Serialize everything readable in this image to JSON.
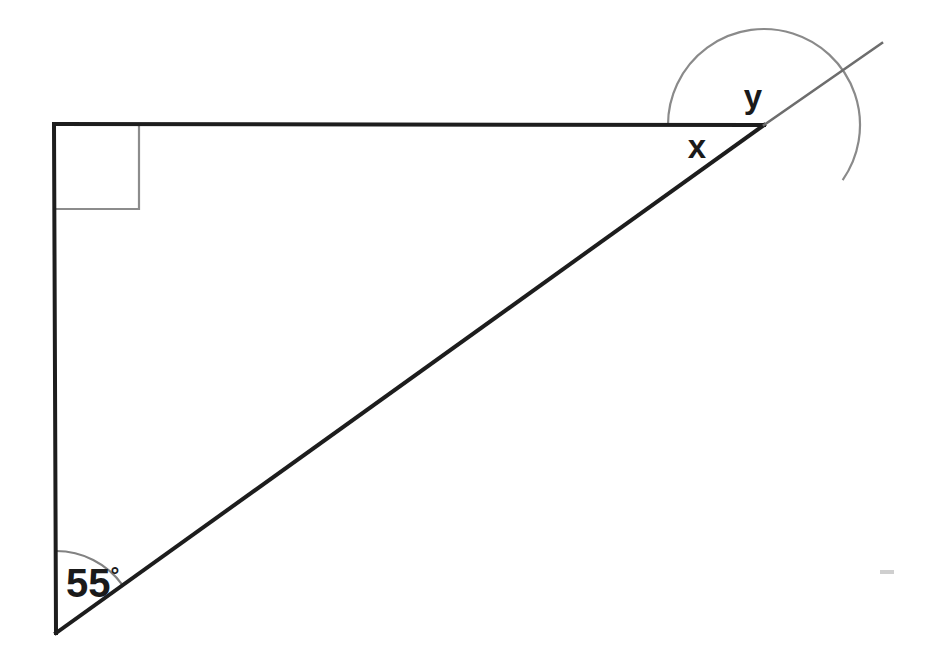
{
  "diagram": {
    "kind": "geometry-figure",
    "background_color": "#ffffff",
    "stroke_color_main": "#1d1d1d",
    "stroke_color_arc": "#7a7a7a",
    "stroke_color_square": "#8c8c8c",
    "labels": {
      "angle_x": "x",
      "angle_y": "y",
      "angle_known_value": "55",
      "degree_symbol": "°",
      "angle_known_full": "55°"
    },
    "vertices": {
      "top_left": {
        "name": "right-angle-vertex",
        "x": 54,
        "y": 124
      },
      "top_right": {
        "name": "exterior-angle-vertex",
        "x": 764,
        "y": 125
      },
      "bottom_left": {
        "name": "base-angle-vertex",
        "x": 56,
        "y": 633
      },
      "ray_end": {
        "name": "ray-endpoint",
        "x": 882,
        "y": 43
      }
    },
    "segments": [
      {
        "name": "top-horizontal-segment",
        "x1": 54,
        "y1": 124,
        "x2": 764,
        "y2": 125
      },
      {
        "name": "left-vertical-segment",
        "x1": 54,
        "y1": 124,
        "x2": 56,
        "y2": 633
      },
      {
        "name": "hypotenuse-segment",
        "x1": 56,
        "y1": 633,
        "x2": 764,
        "y2": 125
      },
      {
        "name": "extension-ray",
        "x1": 764,
        "y1": 125,
        "x2": 882,
        "y2": 43
      }
    ],
    "right_angle_marker": {
      "name": "right-angle-square",
      "x": 54,
      "y": 124,
      "size": 85
    },
    "arcs": {
      "base_angle_arc": {
        "name": "arc-55-degrees",
        "cx": 56,
        "cy": 633,
        "r": 82,
        "start_deg": 270,
        "end_deg": 324
      },
      "exterior_angle_arc": {
        "name": "arc-x-and-y",
        "cx": 764,
        "cy": 125,
        "r": 96,
        "start_deg": 180,
        "end_deg": 395
      }
    },
    "label_positions": {
      "angle_y": {
        "x": 753,
        "y": 108
      },
      "angle_x": {
        "x": 697,
        "y": 158
      },
      "angle_55": {
        "x": 66,
        "y": 597
      }
    },
    "artifact": {
      "name": "scan-artifact-mark",
      "x": 880,
      "y": 570,
      "width": 14,
      "height": 4
    }
  }
}
